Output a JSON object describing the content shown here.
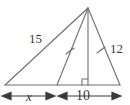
{
  "figure": {
    "type": "geometry-diagram",
    "shape": "triangle-with-cevian-and-altitude",
    "stroke_color": "#6e6e6e",
    "text_color": "#3a3a3a",
    "background": "#ffffff"
  },
  "labels": {
    "left_side": "15",
    "right_side": "12",
    "base_left_segment": "x",
    "base_right_segment": "10"
  },
  "marks": {
    "tick_cevian": "tick-mark",
    "tick_right_side": "tick-mark",
    "right_angle": "right-angle-square"
  },
  "geometry": {
    "apex": [
      88,
      8
    ],
    "left_vertex": [
      5,
      85
    ],
    "right_vertex": [
      120,
      85
    ],
    "cevian_foot": [
      57,
      85
    ],
    "altitude_foot": [
      88,
      85
    ]
  },
  "dimensions": [
    {
      "name": "x",
      "label": "x",
      "x_start": 3,
      "x_end": 55,
      "y": 96
    },
    {
      "name": "ten",
      "label": "10",
      "x_start": 59,
      "x_end": 121,
      "y": 96
    }
  ]
}
